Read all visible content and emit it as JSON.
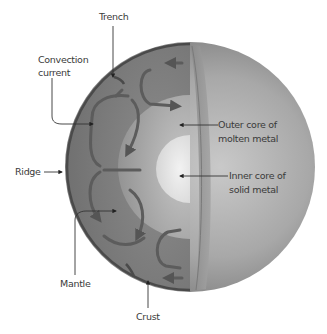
{
  "diagram": {
    "labels": {
      "trench": "Trench",
      "convection_line1": "Convection",
      "convection_line2": "current",
      "ridge": "Ridge",
      "mantle": "Mantle",
      "crust": "Crust",
      "outer_core_line1": "Outer core of",
      "outer_core_line2": "molten metal",
      "inner_core_line1": "Inner core of",
      "inner_core_line2": "solid metal"
    },
    "colors": {
      "background": "#ffffff",
      "sphere_surface": "#8e8e8e",
      "mantle": "#7f7f7f",
      "crust": "#4f4f4f",
      "currents": "#5c5c5c",
      "outer_core": "#b4b4b4",
      "inner_core": "#e4e4e4",
      "text": "#3a3a3a",
      "leader_line": "#333333"
    }
  }
}
